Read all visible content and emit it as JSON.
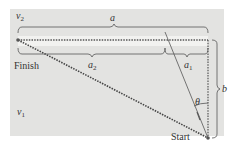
{
  "diagram": {
    "type": "river-crossing-geometry",
    "colors": {
      "panel": "#e3e3e1",
      "line": "#555555",
      "river_band": "#f2f2f0",
      "text": "#333333"
    },
    "labels": {
      "v2": {
        "sym": "v",
        "sub": "2"
      },
      "v1": {
        "sym": "v",
        "sub": "1"
      },
      "a": "a",
      "a1": {
        "sym": "a",
        "sub": "1"
      },
      "a2": {
        "sym": "a",
        "sub": "2"
      },
      "b": "b",
      "theta": "θ",
      "finish": "Finish",
      "start": "Start"
    }
  }
}
